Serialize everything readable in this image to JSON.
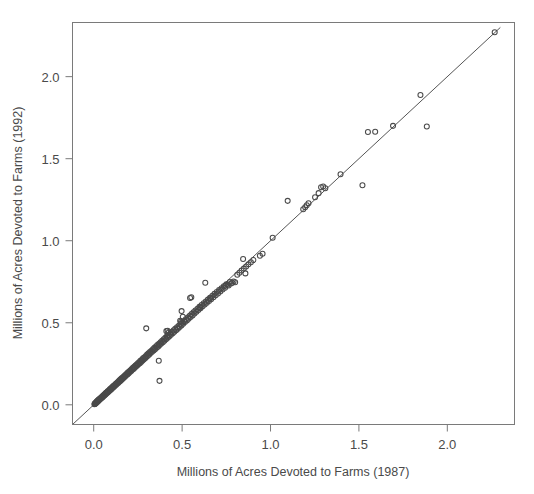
{
  "figure": {
    "background_color": "#ffffff",
    "frame_color": "#7a7a7a",
    "marker_color": "#4a4a4a",
    "line_color": "#555555",
    "text_color": "#4a4a4a",
    "tick_color": "#7a7a7a"
  },
  "chart_data": {
    "type": "scatter",
    "title": "",
    "subtitle": "",
    "xlabel": "Millions of Acres Devoted to Farms (1987)",
    "ylabel": "Millions of Acres Devoted to Farms (1992)",
    "xlim": [
      -0.12,
      2.38
    ],
    "ylim": [
      -0.12,
      2.33
    ],
    "xticks": [
      0.0,
      0.5,
      1.0,
      1.5,
      2.0
    ],
    "xtick_labels": [
      "0.0",
      "0.5",
      "1.0",
      "1.5",
      "2.0"
    ],
    "yticks": [
      0.0,
      0.5,
      1.0,
      1.5,
      2.0
    ],
    "ytick_labels": [
      "0.0",
      "0.5",
      "1.0",
      "1.5",
      "2.0"
    ],
    "grid": false,
    "legend": null,
    "marker": "open-circle",
    "marker_size": 5,
    "annotations": [
      {
        "name": "identity-line",
        "type": "reference-line",
        "description": "y = x diagonal line",
        "slope": 1,
        "intercept": 0,
        "x_start": -0.12,
        "x_end": 2.3
      }
    ],
    "series": [
      {
        "name": "County farm acreage 1987 vs 1992",
        "points": [
          [
            0.004,
            0.004
          ],
          [
            0.006,
            0.005
          ],
          [
            0.007,
            0.008
          ],
          [
            0.009,
            0.007
          ],
          [
            0.01,
            0.011
          ],
          [
            0.012,
            0.01
          ],
          [
            0.013,
            0.014
          ],
          [
            0.015,
            0.013
          ],
          [
            0.016,
            0.018
          ],
          [
            0.018,
            0.016
          ],
          [
            0.019,
            0.021
          ],
          [
            0.021,
            0.019
          ],
          [
            0.022,
            0.024
          ],
          [
            0.024,
            0.022
          ],
          [
            0.025,
            0.028
          ],
          [
            0.027,
            0.025
          ],
          [
            0.028,
            0.031
          ],
          [
            0.03,
            0.029
          ],
          [
            0.031,
            0.034
          ],
          [
            0.033,
            0.031
          ],
          [
            0.035,
            0.037
          ],
          [
            0.036,
            0.034
          ],
          [
            0.038,
            0.04
          ],
          [
            0.04,
            0.038
          ],
          [
            0.042,
            0.044
          ],
          [
            0.044,
            0.041
          ],
          [
            0.046,
            0.048
          ],
          [
            0.048,
            0.045
          ],
          [
            0.05,
            0.052
          ],
          [
            0.052,
            0.049
          ],
          [
            0.054,
            0.056
          ],
          [
            0.056,
            0.053
          ],
          [
            0.058,
            0.06
          ],
          [
            0.06,
            0.057
          ],
          [
            0.062,
            0.064
          ],
          [
            0.064,
            0.061
          ],
          [
            0.066,
            0.069
          ],
          [
            0.068,
            0.065
          ],
          [
            0.07,
            0.073
          ],
          [
            0.073,
            0.07
          ],
          [
            0.075,
            0.077
          ],
          [
            0.077,
            0.074
          ],
          [
            0.079,
            0.082
          ],
          [
            0.082,
            0.078
          ],
          [
            0.084,
            0.086
          ],
          [
            0.086,
            0.083
          ],
          [
            0.089,
            0.091
          ],
          [
            0.091,
            0.087
          ],
          [
            0.093,
            0.096
          ],
          [
            0.096,
            0.092
          ],
          [
            0.098,
            0.101
          ],
          [
            0.101,
            0.097
          ],
          [
            0.103,
            0.106
          ],
          [
            0.106,
            0.102
          ],
          [
            0.108,
            0.111
          ],
          [
            0.111,
            0.107
          ],
          [
            0.113,
            0.116
          ],
          [
            0.116,
            0.112
          ],
          [
            0.119,
            0.121
          ],
          [
            0.121,
            0.117
          ],
          [
            0.124,
            0.127
          ],
          [
            0.127,
            0.122
          ],
          [
            0.129,
            0.132
          ],
          [
            0.132,
            0.128
          ],
          [
            0.135,
            0.138
          ],
          [
            0.138,
            0.133
          ],
          [
            0.141,
            0.143
          ],
          [
            0.143,
            0.139
          ],
          [
            0.146,
            0.149
          ],
          [
            0.149,
            0.144
          ],
          [
            0.152,
            0.155
          ],
          [
            0.155,
            0.15
          ],
          [
            0.158,
            0.161
          ],
          [
            0.161,
            0.156
          ],
          [
            0.164,
            0.167
          ],
          [
            0.167,
            0.162
          ],
          [
            0.17,
            0.173
          ],
          [
            0.173,
            0.168
          ],
          [
            0.176,
            0.179
          ],
          [
            0.179,
            0.174
          ],
          [
            0.182,
            0.185
          ],
          [
            0.186,
            0.181
          ],
          [
            0.189,
            0.192
          ],
          [
            0.192,
            0.187
          ],
          [
            0.195,
            0.198
          ],
          [
            0.198,
            0.193
          ],
          [
            0.202,
            0.205
          ],
          [
            0.205,
            0.2
          ],
          [
            0.208,
            0.211
          ],
          [
            0.212,
            0.206
          ],
          [
            0.215,
            0.218
          ],
          [
            0.218,
            0.213
          ],
          [
            0.222,
            0.225
          ],
          [
            0.225,
            0.219
          ],
          [
            0.229,
            0.232
          ],
          [
            0.232,
            0.226
          ],
          [
            0.236,
            0.239
          ],
          [
            0.239,
            0.233
          ],
          [
            0.243,
            0.246
          ],
          [
            0.246,
            0.24
          ],
          [
            0.25,
            0.253
          ],
          [
            0.253,
            0.247
          ],
          [
            0.257,
            0.26
          ],
          [
            0.261,
            0.254
          ],
          [
            0.264,
            0.268
          ],
          [
            0.268,
            0.261
          ],
          [
            0.272,
            0.275
          ],
          [
            0.275,
            0.269
          ],
          [
            0.279,
            0.283
          ],
          [
            0.283,
            0.276
          ],
          [
            0.287,
            0.29
          ],
          [
            0.291,
            0.284
          ],
          [
            0.295,
            0.298
          ],
          [
            0.298,
            0.291
          ],
          [
            0.302,
            0.306
          ],
          [
            0.306,
            0.299
          ],
          [
            0.31,
            0.314
          ],
          [
            0.314,
            0.307
          ],
          [
            0.318,
            0.322
          ],
          [
            0.322,
            0.315
          ],
          [
            0.297,
            0.466
          ],
          [
            0.326,
            0.33
          ],
          [
            0.33,
            0.323
          ],
          [
            0.335,
            0.338
          ],
          [
            0.339,
            0.331
          ],
          [
            0.343,
            0.347
          ],
          [
            0.347,
            0.339
          ],
          [
            0.352,
            0.355
          ],
          [
            0.356,
            0.348
          ],
          [
            0.36,
            0.364
          ],
          [
            0.365,
            0.356
          ],
          [
            0.369,
            0.372
          ],
          [
            0.373,
            0.365
          ],
          [
            0.378,
            0.381
          ],
          [
            0.368,
            0.268
          ],
          [
            0.372,
            0.146
          ],
          [
            0.382,
            0.373
          ],
          [
            0.387,
            0.39
          ],
          [
            0.391,
            0.382
          ],
          [
            0.396,
            0.399
          ],
          [
            0.4,
            0.391
          ],
          [
            0.405,
            0.408
          ],
          [
            0.409,
            0.4
          ],
          [
            0.414,
            0.417
          ],
          [
            0.419,
            0.409
          ],
          [
            0.423,
            0.426
          ],
          [
            0.428,
            0.418
          ],
          [
            0.411,
            0.449
          ],
          [
            0.418,
            0.452
          ],
          [
            0.424,
            0.441
          ],
          [
            0.433,
            0.435
          ],
          [
            0.437,
            0.427
          ],
          [
            0.442,
            0.445
          ],
          [
            0.447,
            0.436
          ],
          [
            0.452,
            0.454
          ],
          [
            0.456,
            0.445
          ],
          [
            0.461,
            0.463
          ],
          [
            0.466,
            0.455
          ],
          [
            0.471,
            0.473
          ],
          [
            0.476,
            0.464
          ],
          [
            0.481,
            0.482
          ],
          [
            0.486,
            0.474
          ],
          [
            0.491,
            0.492
          ],
          [
            0.496,
            0.484
          ],
          [
            0.489,
            0.512
          ],
          [
            0.494,
            0.506
          ],
          [
            0.501,
            0.501
          ],
          [
            0.506,
            0.494
          ],
          [
            0.497,
            0.571
          ],
          [
            0.504,
            0.537
          ],
          [
            0.511,
            0.511
          ],
          [
            0.516,
            0.504
          ],
          [
            0.521,
            0.522
          ],
          [
            0.527,
            0.514
          ],
          [
            0.532,
            0.532
          ],
          [
            0.537,
            0.524
          ],
          [
            0.543,
            0.543
          ],
          [
            0.548,
            0.535
          ],
          [
            0.553,
            0.553
          ],
          [
            0.559,
            0.545
          ],
          [
            0.545,
            0.651
          ],
          [
            0.552,
            0.655
          ],
          [
            0.564,
            0.564
          ],
          [
            0.57,
            0.556
          ],
          [
            0.575,
            0.575
          ],
          [
            0.581,
            0.567
          ],
          [
            0.587,
            0.586
          ],
          [
            0.592,
            0.578
          ],
          [
            0.598,
            0.597
          ],
          [
            0.604,
            0.589
          ],
          [
            0.61,
            0.608
          ],
          [
            0.616,
            0.6
          ],
          [
            0.602,
            0.593
          ],
          [
            0.622,
            0.619
          ],
          [
            0.628,
            0.611
          ],
          [
            0.634,
            0.63
          ],
          [
            0.64,
            0.622
          ],
          [
            0.631,
            0.744
          ],
          [
            0.646,
            0.641
          ],
          [
            0.652,
            0.633
          ],
          [
            0.658,
            0.653
          ],
          [
            0.664,
            0.644
          ],
          [
            0.671,
            0.664
          ],
          [
            0.677,
            0.656
          ],
          [
            0.661,
            0.651
          ],
          [
            0.683,
            0.676
          ],
          [
            0.69,
            0.667
          ],
          [
            0.696,
            0.688
          ],
          [
            0.703,
            0.679
          ],
          [
            0.709,
            0.699
          ],
          [
            0.716,
            0.691
          ],
          [
            0.723,
            0.711
          ],
          [
            0.729,
            0.703
          ],
          [
            0.736,
            0.723
          ],
          [
            0.743,
            0.714
          ],
          [
            0.75,
            0.735
          ],
          [
            0.745,
            0.726
          ],
          [
            0.757,
            0.732
          ],
          [
            0.763,
            0.727
          ],
          [
            0.77,
            0.748
          ],
          [
            0.777,
            0.74
          ],
          [
            0.784,
            0.744
          ],
          [
            0.791,
            0.752
          ],
          [
            0.8,
            0.747
          ],
          [
            0.812,
            0.793
          ],
          [
            0.824,
            0.805
          ],
          [
            0.836,
            0.818
          ],
          [
            0.845,
            0.889
          ],
          [
            0.849,
            0.83
          ],
          [
            0.858,
            0.801
          ],
          [
            0.862,
            0.843
          ],
          [
            0.875,
            0.856
          ],
          [
            0.889,
            0.869
          ],
          [
            0.903,
            0.882
          ],
          [
            0.94,
            0.908
          ],
          [
            0.955,
            0.921
          ],
          [
            1.012,
            1.018
          ],
          [
            1.097,
            1.243
          ],
          [
            1.185,
            1.192
          ],
          [
            1.196,
            1.204
          ],
          [
            1.205,
            1.216
          ],
          [
            1.215,
            1.228
          ],
          [
            1.252,
            1.265
          ],
          [
            1.272,
            1.29
          ],
          [
            1.286,
            1.326
          ],
          [
            1.298,
            1.33
          ],
          [
            1.31,
            1.32
          ],
          [
            1.396,
            1.405
          ],
          [
            1.52,
            1.338
          ],
          [
            1.551,
            1.663
          ],
          [
            1.592,
            1.664
          ],
          [
            1.693,
            1.7
          ],
          [
            1.848,
            1.888
          ],
          [
            1.884,
            1.696
          ],
          [
            2.268,
            2.27
          ]
        ]
      }
    ]
  },
  "axis_titles": {
    "x": "Millions of Acres Devoted to Farms (1987)",
    "y": "Millions of Acres Devoted to Farms (1992)"
  }
}
